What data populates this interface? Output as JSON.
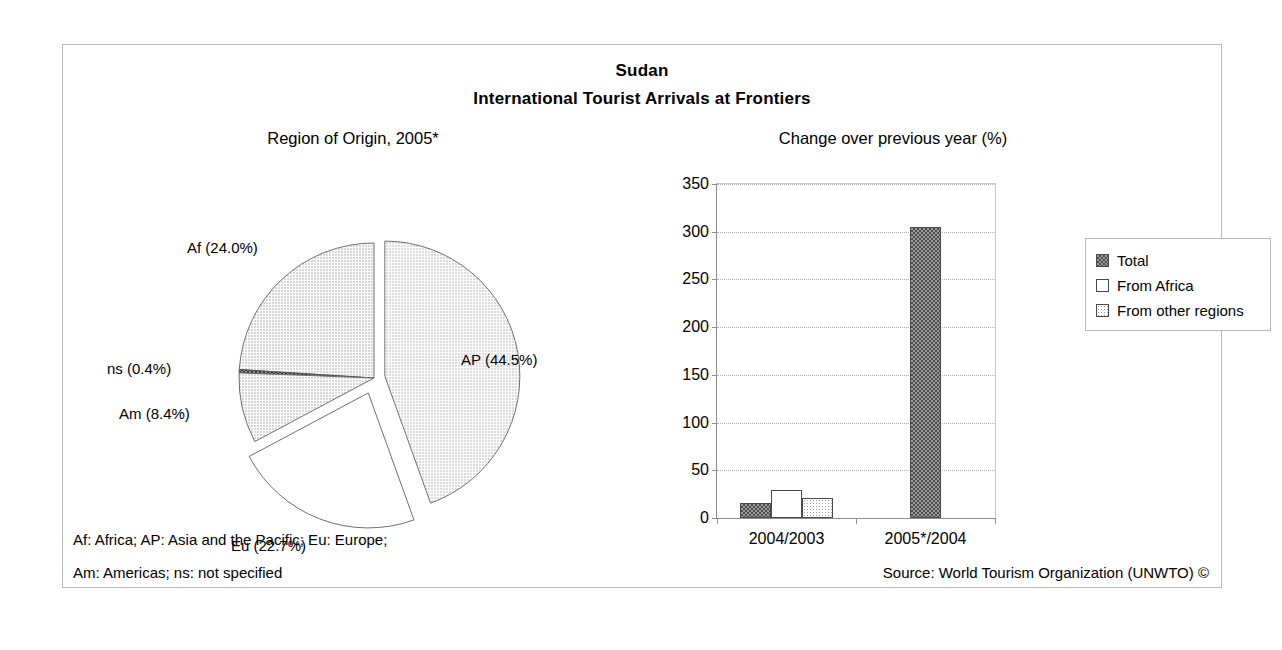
{
  "header": {
    "country": "Sudan",
    "subtitle": "International Tourist Arrivals at Frontiers"
  },
  "panels": {
    "pie_title": "Region of Origin, 2005*",
    "bar_title": "Change over previous year (%)"
  },
  "footnotes": {
    "line1": "Af: Africa; AP: Asia and the Pacific; Eu: Europe;",
    "line2": "Am: Americas; ns: not specified",
    "source": "Source: World Tourism Organization (UNWTO) ©"
  },
  "legend": {
    "items": [
      {
        "label": "Total",
        "pattern": "checkered-dark",
        "color": "#4d4d4d"
      },
      {
        "label": "From Africa",
        "pattern": "solid-white",
        "color": "#ffffff"
      },
      {
        "label": "From other regions",
        "pattern": "dotted-light",
        "color": "#d8d8d8"
      }
    ]
  },
  "pie_labels": {
    "ap": "AP (44.5%)",
    "af": "Af (24.0%)",
    "ns": "ns (0.4%)",
    "am": "Am (8.4%)",
    "eu": "Eu (22.7%)"
  },
  "axis": {
    "y_ticks": [
      "0",
      "50",
      "100",
      "150",
      "200",
      "250",
      "300",
      "350"
    ],
    "x_categories": [
      "2004/2003",
      "2005*/2004"
    ]
  },
  "chart_data": [
    {
      "type": "pie",
      "title": "Region of Origin, 2005*",
      "labels": [
        "AP",
        "Af",
        "Eu",
        "Am",
        "ns"
      ],
      "label_texts": [
        "AP (44.5%)",
        "Af (24.0%)",
        "Eu (22.7%)",
        "Am (8.4%)",
        "ns (0.4%)"
      ],
      "values": [
        44.5,
        24.0,
        22.7,
        8.4,
        0.4
      ],
      "units": "percent",
      "exploded": [
        "AP",
        "Eu"
      ],
      "legend": "labels-outside"
    },
    {
      "type": "bar",
      "title": "Change over previous year (%)",
      "categories": [
        "2004/2003",
        "2005*/2004"
      ],
      "series": [
        {
          "name": "Total",
          "values": [
            16,
            305
          ]
        },
        {
          "name": "From Africa",
          "values": [
            29,
            null
          ]
        },
        {
          "name": "From other regions",
          "values": [
            21,
            null
          ]
        }
      ],
      "xlabel": "",
      "ylabel": "",
      "ylim": [
        0,
        350
      ],
      "ytick_step": 50,
      "grid": true,
      "legend_position": "right-outside"
    }
  ]
}
